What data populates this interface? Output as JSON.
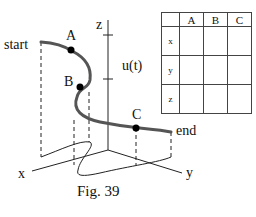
{
  "figure": {
    "caption": "Fig. 39",
    "curve_labels": {
      "start": "start",
      "end": "end"
    },
    "points": [
      {
        "name": "A"
      },
      {
        "name": "B"
      },
      {
        "name": "C"
      }
    ],
    "axes": {
      "x": "x",
      "y": "y",
      "z": "z"
    },
    "function_label": "u(t)",
    "colors": {
      "curve": "#555555",
      "axes": "#222222",
      "points": "#000000"
    }
  },
  "table": {
    "columns": [
      "",
      "A",
      "B",
      "C"
    ],
    "rows": [
      {
        "label": "x",
        "cells": [
          "",
          "",
          ""
        ]
      },
      {
        "label": "y",
        "cells": [
          "",
          "",
          ""
        ]
      },
      {
        "label": "z",
        "cells": [
          "",
          "",
          ""
        ]
      }
    ]
  }
}
